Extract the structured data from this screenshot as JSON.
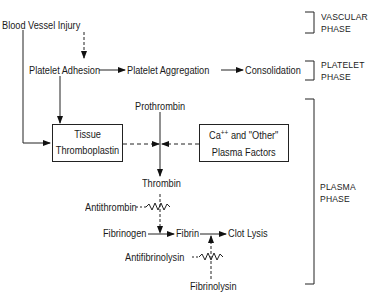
{
  "nodes": {
    "injury": "Blood Vessel Injury",
    "adhesion": "Platelet Adhesion",
    "aggregation": "Platelet Aggregation",
    "consolidation": "Consolidation",
    "prothrombin": "Prothrombin",
    "tissue_line1": "Tissue",
    "tissue_line2": "Thromboplastin",
    "ca_prefix": "Ca",
    "ca_sup": "++",
    "ca_suffix": " and \"Other\"",
    "plasma_factors": "Plasma Factors",
    "thrombin": "Thrombin",
    "antithrombin": "Antithrombin",
    "fibrinogen": "Fibrinogen",
    "fibrin": "Fibrin",
    "clot_lysis": "Clot Lysis",
    "antifibrinolysin": "Antifibrinolysin",
    "fibrinolysin": "Fibrinolysin"
  },
  "phases": {
    "vascular_1": "VASCULAR",
    "vascular_2": "PHASE",
    "platelet_1": "PLATELET",
    "platelet_2": "PHASE",
    "plasma_1": "PLASMA",
    "plasma_2": "PHASE"
  }
}
